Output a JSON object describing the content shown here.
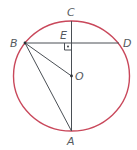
{
  "diagram": {
    "title": "",
    "circle_color": "#c9485b",
    "line_color": "#4a4f55",
    "points": {
      "A": {
        "label": "A"
      },
      "B": {
        "label": "B"
      },
      "C": {
        "label": "C"
      },
      "D": {
        "label": "D"
      },
      "E": {
        "label": "E"
      },
      "O": {
        "label": "O"
      }
    },
    "segments": [
      "CA",
      "BD",
      "BO",
      "BA"
    ],
    "annotations": [
      "right angle at E between CA and BD",
      "O is the center of the circle"
    ]
  }
}
